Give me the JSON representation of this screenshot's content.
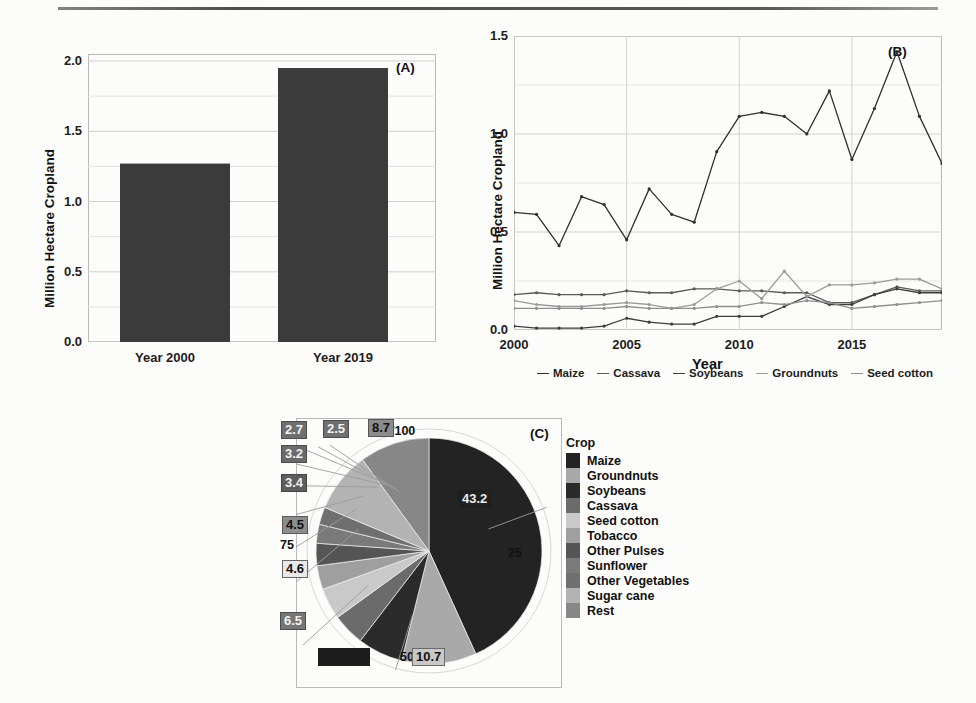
{
  "figure": {
    "panels": [
      "(A)",
      "(B)",
      "(C)"
    ]
  },
  "chart_data": [
    {
      "type": "bar",
      "panel": "(A)",
      "title": "",
      "xlabel": "",
      "ylabel": "Million Hectare Cropland",
      "categories": [
        "Year 2000",
        "Year 2019"
      ],
      "values": [
        1.27,
        1.95
      ],
      "ylim": [
        0.0,
        2.05
      ],
      "yticks": [
        "0.0",
        "0.5",
        "1.0",
        "1.5",
        "2.0"
      ],
      "ytickvals": [
        0.0,
        0.5,
        1.0,
        1.5,
        2.0
      ],
      "grid": true,
      "bar_color": "#3b3b3b"
    },
    {
      "type": "line",
      "panel": "(B)",
      "title": "",
      "xlabel": "Year",
      "ylabel": "Million Hectare Cropland",
      "x": [
        2000,
        2001,
        2002,
        2003,
        2004,
        2005,
        2006,
        2007,
        2008,
        2009,
        2010,
        2011,
        2012,
        2013,
        2014,
        2015,
        2016,
        2017,
        2018,
        2019
      ],
      "xlim": [
        2000,
        2019
      ],
      "ylim": [
        0.0,
        1.5
      ],
      "xticks": [
        "2000",
        "2005",
        "2010",
        "2015"
      ],
      "xtickvals": [
        2000,
        2005,
        2010,
        2015
      ],
      "yticks": [
        "0.0",
        "0.5",
        "1.0",
        "1.5"
      ],
      "ytickvals": [
        0.0,
        0.5,
        1.0,
        1.5
      ],
      "grid": true,
      "legend_position": "bottom",
      "series": [
        {
          "name": "Maize",
          "color": "#2f2f2f",
          "values": [
            0.6,
            0.59,
            0.43,
            0.68,
            0.64,
            0.46,
            0.72,
            0.59,
            0.55,
            0.91,
            1.09,
            1.11,
            1.09,
            1.0,
            1.22,
            0.87,
            1.13,
            1.42,
            1.09,
            0.85
          ]
        },
        {
          "name": "Cassava",
          "color": "#5a5a5a",
          "values": [
            0.18,
            0.19,
            0.18,
            0.18,
            0.18,
            0.2,
            0.19,
            0.19,
            0.21,
            0.21,
            0.2,
            0.2,
            0.19,
            0.19,
            0.14,
            0.14,
            0.18,
            0.22,
            0.2,
            0.2
          ]
        },
        {
          "name": "Soybeans",
          "color": "#3d3d3d",
          "values": [
            0.02,
            0.01,
            0.01,
            0.01,
            0.02,
            0.06,
            0.04,
            0.03,
            0.03,
            0.07,
            0.07,
            0.07,
            0.12,
            0.17,
            0.13,
            0.13,
            0.18,
            0.21,
            0.19,
            0.19
          ]
        },
        {
          "name": "Groundnuts",
          "color": "#9a9a9a",
          "values": [
            0.15,
            0.13,
            0.12,
            0.12,
            0.13,
            0.14,
            0.13,
            0.11,
            0.13,
            0.21,
            0.25,
            0.16,
            0.3,
            0.17,
            0.23,
            0.23,
            0.24,
            0.26,
            0.26,
            0.21
          ]
        },
        {
          "name": "Seed cotton",
          "color": "#8f8f8f",
          "values": [
            0.11,
            0.11,
            0.11,
            0.11,
            0.11,
            0.12,
            0.11,
            0.11,
            0.11,
            0.12,
            0.12,
            0.14,
            0.13,
            0.15,
            0.14,
            0.11,
            0.12,
            0.13,
            0.14,
            0.15
          ]
        }
      ]
    },
    {
      "type": "pie",
      "panel": "(C)",
      "title": "",
      "legend_title": "Crop",
      "axis_ticks": [
        "0/100",
        "25",
        "50",
        "75"
      ],
      "labels": [
        "Maize",
        "Groundnuts",
        "Soybeans",
        "Cassava",
        "Seed cotton",
        "Tobacco",
        "Other Pulses",
        "Sunflower",
        "Other Vegetables",
        "Sugar cane",
        "Rest"
      ],
      "values": [
        43.2,
        10.7,
        6.5,
        4.6,
        4.5,
        3.4,
        3.2,
        2.7,
        2.5,
        8.7,
        10.0
      ],
      "data_labels": [
        "43.2",
        "10.7",
        "6.5",
        "4.6",
        "4.5",
        "3.4",
        "3.2",
        "2.7",
        "2.5",
        "8.7",
        ""
      ],
      "colors": [
        "#232323",
        "#a9a9a9",
        "#2b2b2b",
        "#6b6b6b",
        "#c9c9c9",
        "#9f9f9f",
        "#555555",
        "#7a7a7a",
        "#6f6f6f",
        "#b3b3b3",
        "#878787"
      ]
    }
  ],
  "panelA": {
    "tag": "(A)",
    "ylabel": "Million Hectare Cropland",
    "yticks": [
      "0.0",
      "0.5",
      "1.0",
      "1.5",
      "2.0"
    ],
    "cat0": "Year 2000",
    "cat1": "Year 2019"
  },
  "panelB": {
    "tag": "(B)",
    "ylabel": "Million Hectare Cropland",
    "xlabel": "Year",
    "yticks": [
      "0.0",
      "0.5",
      "1.0",
      "1.5"
    ],
    "xticks": [
      "2000",
      "2005",
      "2010",
      "2015"
    ],
    "legend": [
      "Maize",
      "Cassava",
      "Soybeans",
      "Groundnuts",
      "Seed cotton"
    ]
  },
  "panelC": {
    "tag": "(C)",
    "ticks": {
      "t0": "0/100",
      "t25": "25",
      "t50": "50",
      "t75": "75"
    },
    "labels": {
      "maize": "43.2",
      "groundnuts": "10.7",
      "soybeans": "6.5",
      "cassava": "4.6",
      "seedcotton": "4.5",
      "tobacco": "3.4",
      "otherpulses": "3.2",
      "sunflower": "2.7",
      "othervegetables": "2.5",
      "sugarcane": "8.7",
      "rest": ""
    },
    "legend_title": "Crop",
    "legend": [
      "Maize",
      "Groundnuts",
      "Soybeans",
      "Cassava",
      "Seed cotton",
      "Tobacco",
      "Other Pulses",
      "Sunflower",
      "Other Vegetables",
      "Sugar cane",
      "Rest"
    ]
  }
}
